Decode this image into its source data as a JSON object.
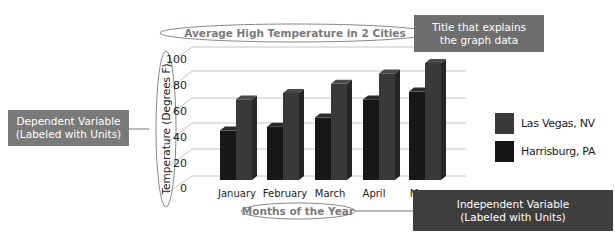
{
  "chart_data": {
    "type": "bar",
    "style": "3d-clustered-column",
    "title": "Average High Temperature in 2 Cities",
    "xlabel": "Months of the Year",
    "ylabel": "Temperature (Degrees F)",
    "categories": [
      "January",
      "February",
      "March",
      "April",
      "May"
    ],
    "series": [
      {
        "name": "Harrisburg, PA",
        "color": "#1c1c1c",
        "values": [
          38,
          41,
          48,
          62,
          68
        ]
      },
      {
        "name": "Las Vegas, NV",
        "color": "#3a3a3a",
        "values": [
          62,
          67,
          74,
          82,
          90
        ]
      }
    ],
    "yticks": [
      0,
      20,
      40,
      60,
      80,
      100
    ],
    "ylim": [
      0,
      100
    ],
    "grid": true,
    "legend_position": "right",
    "legend_order": [
      "Las Vegas, NV",
      "Harrisburg, PA"
    ]
  },
  "labels": {
    "title": "Average High Temperature in 2 Cities",
    "xlabel": "Months of the Year",
    "ylabel": "Temperature (Degrees F)",
    "yticks": [
      "0",
      "20",
      "40",
      "60",
      "80",
      "100"
    ],
    "months": [
      "January",
      "February",
      "March",
      "April",
      "May"
    ]
  },
  "legend": {
    "items": [
      {
        "label": "Las Vegas, NV",
        "color": "#3a3a3a"
      },
      {
        "label": "Harrisburg, PA",
        "color": "#161616"
      }
    ]
  },
  "callouts": {
    "title_note": {
      "line1": "Title that explains",
      "line2": "the graph data",
      "color": "#6e6e6e"
    },
    "dependent_note": {
      "line1": "Dependent Variable",
      "line2": "(Labeled with Units)",
      "color": "#7a7a7a"
    },
    "independent_note": {
      "line1": "Independent Variable",
      "line2": "(Labeled with Units)",
      "color": "#3e3e3e"
    }
  }
}
